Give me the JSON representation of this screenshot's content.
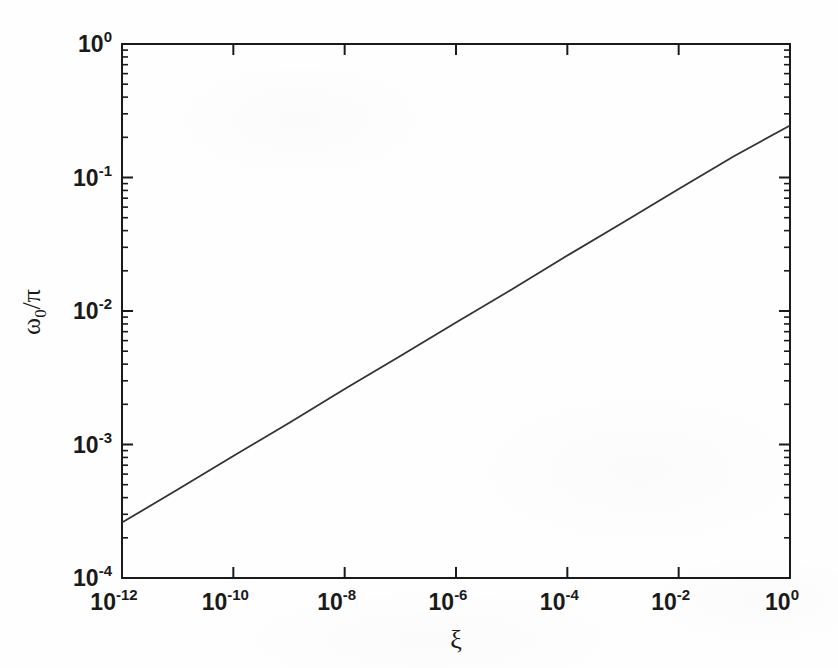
{
  "figure": {
    "background_color": "#fefefe",
    "line_color": "#333333",
    "axis_color": "#1a1a1a"
  },
  "chart_data": {
    "type": "line",
    "title": "",
    "xlabel": "ξ",
    "ylabel": "ω₀/π",
    "xscale": "log",
    "yscale": "log",
    "xlim": [
      1e-12,
      1
    ],
    "ylim": [
      0.0001,
      1
    ],
    "grid": false,
    "legend": null,
    "x_tick_labels": [
      "10-12",
      "10-10",
      "10-8",
      "10-6",
      "10-4",
      "10-2",
      "100"
    ],
    "x_tick_mantissas": [
      "10",
      "10",
      "10",
      "10",
      "10",
      "10",
      "10"
    ],
    "x_tick_exponents": [
      "-12",
      "-10",
      "-8",
      "-6",
      "-4",
      "-2",
      "0"
    ],
    "x_tick_values": [
      1e-12,
      1e-10,
      1e-08,
      1e-06,
      0.0001,
      0.01,
      1
    ],
    "y_tick_mantissas": [
      "10",
      "10",
      "10",
      "10",
      "10"
    ],
    "y_tick_exponents": [
      "0",
      "-1",
      "-2",
      "-3",
      "-4"
    ],
    "y_tick_values": [
      1,
      0.1,
      0.01,
      0.001,
      0.0001
    ],
    "minor_ticks": "log-decade",
    "series": [
      {
        "name": "omega0-over-pi",
        "x": [
          1e-12,
          1e-11,
          1e-10,
          1e-09,
          1e-08,
          1e-07,
          1e-06,
          1e-05,
          0.0001,
          0.001,
          0.01,
          0.1,
          1
        ],
        "y": [
          0.00026,
          0.00046,
          0.00082,
          0.00145,
          0.0026,
          0.0046,
          0.0082,
          0.0145,
          0.026,
          0.046,
          0.082,
          0.145,
          0.245
        ],
        "slope_loglog": 0.248,
        "style": "solid"
      }
    ],
    "annotations": []
  },
  "axes": {
    "x_axis_name": "xi-axis",
    "y_axis_name": "omega0-over-pi-axis"
  }
}
